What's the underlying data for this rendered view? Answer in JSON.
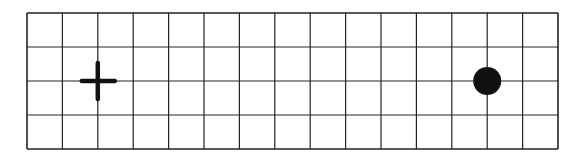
{
  "grid": {
    "columns": 15,
    "rows": 4,
    "left": 27,
    "top": 13,
    "right": 558,
    "bottom": 149,
    "line_color": "#222222",
    "background": "#ffffff"
  },
  "markers": [
    {
      "type": "cross",
      "col": 2,
      "row": 2,
      "color": "#111111"
    },
    {
      "type": "dot",
      "col": 13,
      "row": 2,
      "color": "#111111"
    }
  ]
}
